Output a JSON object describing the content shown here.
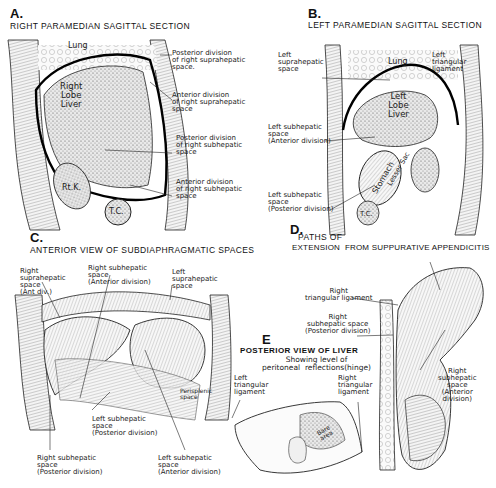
{
  "panels": {
    "A": {
      "letter": "A.",
      "title": "RIGHT PARAMEDIAN SAGITTAL SECTION",
      "organs": {
        "lung": "Lung",
        "liver": "Right\nLobe\nLiver",
        "kidney": "Rt.K.",
        "colon": "T.C."
      },
      "labels": [
        "Posterior division\nof right suprahepatic\nspace.",
        "Anterior division\nof right suprahepatic\nspace",
        "Posterior division\nof right subhepatic\nspace",
        "Anterior division\nof right subhepatic\nspace"
      ]
    },
    "B": {
      "letter": "B.",
      "title": "LEFT PARAMEDIAN SAGITTAL SECTION",
      "organs": {
        "lung": "Lung",
        "liver": "Left\nLobe\nLiver",
        "stomach": "Stomach",
        "lesser_sac": "Lesser Sac",
        "colon": "T.C."
      },
      "labels": [
        "Left\nsuprahepatic\nspace",
        "Left\ntriangular\nligament",
        "Left subhepatic\nspace\n(Anterior division)",
        "Left subhepatic\nspace\n(Posterior division)"
      ]
    },
    "C": {
      "letter": "C.",
      "title": "ANTERIOR VIEW OF SUBDIAPHRAGMATIC SPACES",
      "labels": [
        "Right\nsuprahepatic\nspace\n(Ant div.)",
        "Right subhepatic\nspace\n(Anterior division)",
        "Left\nsuprahepatic\nspace",
        "Perisplenic\nspace",
        "Left subhepatic\nspace\n(Posterior division)",
        "Right subhepatic\nspace\n(Posterior division)",
        "Left subhepatic\nspace\n(Anterior division)"
      ]
    },
    "D": {
      "letter": "D.",
      "title_line1": "PATHS OF",
      "title_line2": "EXTENSION  FROM SUPPURATIVE APPENDICITIS",
      "labels": [
        "Right\ntriangular ligament",
        "Right\nsubhepatic space\n(Posterior division)",
        "Right\nsubhepatic\nspace\n(Anterior\ndivision)"
      ]
    },
    "E": {
      "letter": "E",
      "title": "POSTERIOR VIEW OF LIVER",
      "subtitle": "Showing level of\nperitoneal  reflections(hinge)",
      "organs": {
        "bare_area": "Bare\narea"
      },
      "labels": [
        "Left\ntriangular\nligament",
        "Right\ntriangular\nligament"
      ]
    }
  }
}
